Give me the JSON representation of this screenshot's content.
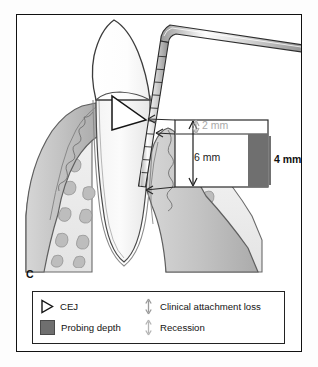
{
  "figure": {
    "panel_label": "C"
  },
  "measurements": {
    "recession": {
      "value": "2 mm",
      "color": "#a9a9a9",
      "name": "recession"
    },
    "clinical_attachment_loss": {
      "value": "6 mm",
      "color": "#1b1b1b",
      "name": "clinical-attachment-loss"
    },
    "probing_depth": {
      "value": "4 mm",
      "color": "#111111",
      "name": "probing-depth"
    }
  },
  "legend": {
    "items": [
      {
        "icon": "cej-triangle-icon",
        "label": "CEJ"
      },
      {
        "icon": "probing-depth-swatch-icon",
        "label": "Probing depth"
      },
      {
        "icon": "double-arrow-dark-icon",
        "label": "Clinical attachment loss"
      },
      {
        "icon": "double-arrow-light-icon",
        "label": "Recession"
      }
    ]
  },
  "anatomy": {
    "parts": [
      "tooth-crown",
      "tooth-root",
      "cemento-enamel-junction",
      "gingiva-left",
      "gingiva-right",
      "alveolar-bone-left",
      "alveolar-bone-right",
      "periodontal-ligament",
      "periodontal-probe"
    ]
  },
  "colors": {
    "frame": "#111111",
    "probing_depth_fill": "#6f6f6f",
    "gingiva_fill": "#c8c8c8",
    "bone_fill": "#ededed",
    "trabecula_fill": "#b9b9b9",
    "light_gray": "#a9a9a9"
  }
}
